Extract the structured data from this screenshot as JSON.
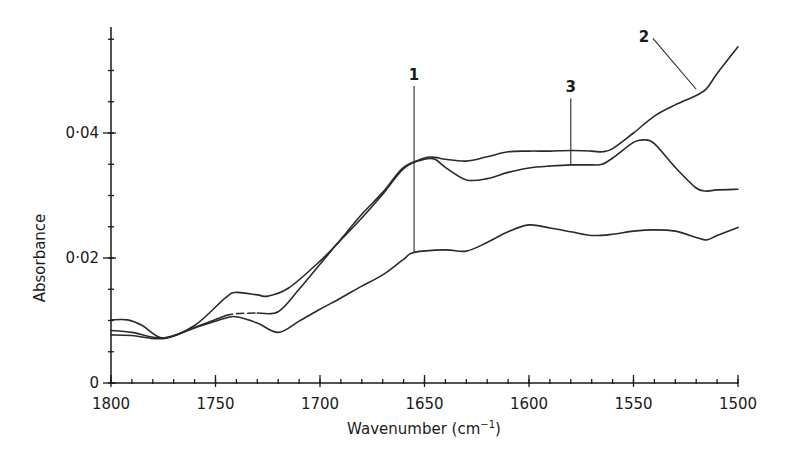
{
  "chart_data": {
    "type": "line",
    "title": "",
    "xlabel": "Wavenumber (cm⁻¹)",
    "xlabel_base": "Wavenumber (cm",
    "xlabel_sup": "−1",
    "xlabel_close": ")",
    "ylabel": "Absorbance",
    "xlim": [
      1800,
      1500
    ],
    "x_reversed": true,
    "ylim": [
      0,
      0.057
    ],
    "grid": false,
    "legend": "inline numeric labels with leader lines",
    "x_ticks": [
      1800,
      1750,
      1700,
      1650,
      1600,
      1550,
      1500
    ],
    "x_tick_labels": [
      "1800",
      "1750",
      "1700",
      "1650",
      "1600",
      "1550",
      "1500"
    ],
    "x_minor_tick_step": 10,
    "y_ticks": [
      0,
      0.02,
      0.04
    ],
    "y_tick_labels": [
      "0",
      "0·02",
      "0·04"
    ],
    "y_minor_tick_step": 0.005,
    "series": [
      {
        "name": "1",
        "label_pos": {
          "x": 1655,
          "y": 0.0485
        },
        "leader_to": {
          "x": 1655,
          "y": 0.021
        },
        "x": [
          1800,
          1790,
          1775,
          1760,
          1745,
          1740,
          1730,
          1720,
          1710,
          1700,
          1690,
          1680,
          1670,
          1660,
          1655,
          1640,
          1630,
          1620,
          1610,
          1600,
          1590,
          1580,
          1570,
          1560,
          1550,
          1540,
          1530,
          1520,
          1515,
          1510,
          1500
        ],
        "values": [
          0.0077,
          0.0076,
          0.0071,
          0.0088,
          0.0104,
          0.0106,
          0.0096,
          0.0081,
          0.0099,
          0.0118,
          0.0136,
          0.0155,
          0.0173,
          0.0198,
          0.0209,
          0.0213,
          0.0211,
          0.0225,
          0.0242,
          0.0253,
          0.0248,
          0.0242,
          0.0236,
          0.0238,
          0.0243,
          0.0245,
          0.0243,
          0.0233,
          0.0229,
          0.0236,
          0.0249
        ]
      },
      {
        "name": "2",
        "label_pos": {
          "x": 1545,
          "y": 0.0545
        },
        "leader_to": {
          "x": 1520,
          "y": 0.047
        },
        "x": [
          1800,
          1790,
          1775,
          1760,
          1745,
          1740,
          1730,
          1725,
          1715,
          1700,
          1690,
          1680,
          1670,
          1660,
          1650,
          1645,
          1640,
          1630,
          1620,
          1610,
          1600,
          1590,
          1580,
          1570,
          1565,
          1560,
          1550,
          1540,
          1530,
          1520,
          1515,
          1510,
          1500
        ],
        "values": [
          0.0084,
          0.0081,
          0.0072,
          0.0092,
          0.0137,
          0.0145,
          0.0141,
          0.0139,
          0.0152,
          0.0195,
          0.0229,
          0.0264,
          0.0302,
          0.0343,
          0.036,
          0.0361,
          0.0358,
          0.0355,
          0.0362,
          0.037,
          0.0371,
          0.0371,
          0.0372,
          0.0371,
          0.037,
          0.0375,
          0.04,
          0.0427,
          0.0445,
          0.046,
          0.0471,
          0.0495,
          0.0538
        ]
      },
      {
        "name": "3",
        "label_pos": {
          "x": 1580,
          "y": 0.0465
        },
        "leader_to": {
          "x": 1580,
          "y": 0.0349
        },
        "dashed_segment": [
          1745,
          1730
        ],
        "x": [
          1800,
          1792,
          1785,
          1775,
          1760,
          1745,
          1740,
          1730,
          1720,
          1710,
          1700,
          1690,
          1680,
          1670,
          1660,
          1650,
          1645,
          1640,
          1630,
          1620,
          1610,
          1600,
          1590,
          1580,
          1570,
          1565,
          1560,
          1550,
          1545,
          1540,
          1530,
          1520,
          1515,
          1510,
          1500
        ],
        "values": [
          0.0101,
          0.0101,
          0.0092,
          0.0072,
          0.0089,
          0.0108,
          0.0111,
          0.0112,
          0.0114,
          0.015,
          0.019,
          0.023,
          0.027,
          0.0305,
          0.0345,
          0.0358,
          0.0358,
          0.0345,
          0.0325,
          0.0327,
          0.0337,
          0.0344,
          0.0347,
          0.0349,
          0.0349,
          0.035,
          0.036,
          0.0385,
          0.0389,
          0.0383,
          0.0345,
          0.0312,
          0.0307,
          0.0309,
          0.031
        ]
      }
    ]
  },
  "layout": {
    "plot_px": {
      "x_left": 111,
      "x_right": 738,
      "y_zero": 383,
      "y_per_unit": 6250,
      "y_axis_top": 27
    },
    "line_color": "#2a2a2a",
    "background": "#ffffff"
  }
}
